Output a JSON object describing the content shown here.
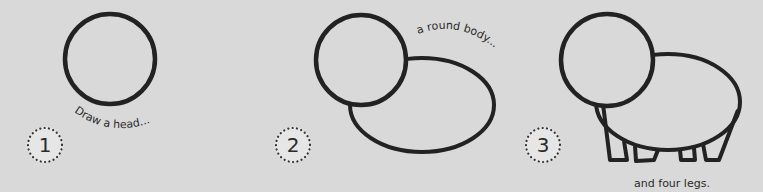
{
  "steps": [
    {
      "number": "1",
      "caption": "Draw a head..."
    },
    {
      "number": "2",
      "caption": "a round body..."
    },
    {
      "number": "3",
      "caption": "and four legs."
    }
  ],
  "colors": {
    "background": "#d9d9d9",
    "ink": "#222222",
    "badge_fill": "#e6e6e6"
  }
}
